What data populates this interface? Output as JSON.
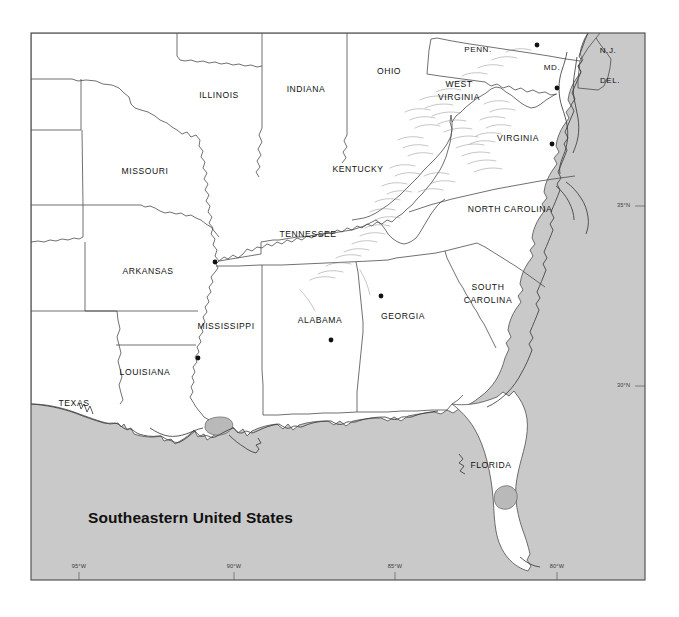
{
  "figure": {
    "title": "Southeastern United States",
    "frame": {
      "x": 31,
      "y": 33,
      "width": 614,
      "height": 547
    },
    "colors": {
      "ocean": "#c9c9c9",
      "land": "#ffffff",
      "border": "#4c4c4c",
      "lake": "#b9b9b9",
      "mountain_hachure": "#8d8d8d",
      "text": "#111111",
      "frame": "#555555",
      "page_background": "#ffffff"
    }
  },
  "map": {
    "projection_note": "",
    "state_labels": [
      {
        "name": "ILLINOIS",
        "text": "ILLINOIS",
        "x": 219,
        "y": 96,
        "size": "normal"
      },
      {
        "name": "INDIANA",
        "text": "INDIANA",
        "x": 306,
        "y": 90,
        "size": "normal"
      },
      {
        "name": "OHIO",
        "text": "OHIO",
        "x": 389,
        "y": 72,
        "size": "normal"
      },
      {
        "name": "PENN.",
        "text": "PENN.",
        "x": 478,
        "y": 50,
        "size": "small"
      },
      {
        "name": "N.J.",
        "text": "N.J.",
        "x": 608,
        "y": 51,
        "size": "small"
      },
      {
        "name": "MD.",
        "text": "MD.",
        "x": 552,
        "y": 68,
        "size": "small"
      },
      {
        "name": "DEL.",
        "text": "DEL.",
        "x": 610,
        "y": 81,
        "size": "small"
      },
      {
        "name": "WEST-VIRGINIA-1",
        "text": "WEST",
        "x": 459,
        "y": 85,
        "size": "normal"
      },
      {
        "name": "WEST-VIRGINIA-2",
        "text": "VIRGINIA",
        "x": 459,
        "y": 98,
        "size": "normal"
      },
      {
        "name": "VIRGINIA",
        "text": "VIRGINIA",
        "x": 518,
        "y": 139,
        "size": "normal"
      },
      {
        "name": "MISSOURI",
        "text": "MISSOURI",
        "x": 145,
        "y": 172,
        "size": "normal"
      },
      {
        "name": "KENTUCKY",
        "text": "KENTUCKY",
        "x": 358,
        "y": 170,
        "size": "normal"
      },
      {
        "name": "NORTH-CAROLINA",
        "text": "NORTH  CAROLINA",
        "x": 510,
        "y": 210,
        "size": "normal"
      },
      {
        "name": "TENNESSEE",
        "text": "TENNESSEE",
        "x": 308,
        "y": 235,
        "size": "normal"
      },
      {
        "name": "ARKANSAS",
        "text": "ARKANSAS",
        "x": 148,
        "y": 272,
        "size": "normal"
      },
      {
        "name": "SOUTH-CAROLINA-1",
        "text": "SOUTH",
        "x": 488,
        "y": 288,
        "size": "normal"
      },
      {
        "name": "SOUTH-CAROLINA-2",
        "text": "CAROLINA",
        "x": 488,
        "y": 301,
        "size": "normal"
      },
      {
        "name": "GEORGIA",
        "text": "GEORGIA",
        "x": 403,
        "y": 317,
        "size": "normal"
      },
      {
        "name": "ALABAMA",
        "text": "ALABAMA",
        "x": 320,
        "y": 321,
        "size": "normal"
      },
      {
        "name": "MISSISSIPPI",
        "text": "MISSISSIPPI",
        "x": 226,
        "y": 327,
        "size": "normal"
      },
      {
        "name": "LOUISIANA",
        "text": "LOUISIANA",
        "x": 145,
        "y": 373,
        "size": "normal"
      },
      {
        "name": "TEXAS",
        "text": "TEXAS",
        "x": 74,
        "y": 404,
        "size": "normal"
      },
      {
        "name": "FLORIDA",
        "text": "FLORIDA",
        "x": 491,
        "y": 466,
        "size": "normal"
      }
    ],
    "city_dots": [
      {
        "name": "city-dot-memphis",
        "x": 215,
        "y": 262
      },
      {
        "name": "city-dot-jackson",
        "x": 198,
        "y": 358
      },
      {
        "name": "city-dot-birmingham",
        "x": 331,
        "y": 340
      },
      {
        "name": "city-dot-atlanta",
        "x": 381,
        "y": 296
      },
      {
        "name": "city-dot-harrisburg",
        "x": 537,
        "y": 45
      },
      {
        "name": "city-dot-annapolis",
        "x": 557,
        "y": 88
      },
      {
        "name": "city-dot-richmond",
        "x": 552,
        "y": 144
      }
    ],
    "graticule": {
      "longitude_labels": [
        {
          "name": "lon-95w",
          "text": "95°W",
          "x": 79,
          "y": 567,
          "tick_x": 79
        },
        {
          "name": "lon-90w",
          "text": "90°W",
          "x": 234,
          "y": 567,
          "tick_x": 234
        },
        {
          "name": "lon-85w",
          "text": "85°W",
          "x": 395,
          "y": 567,
          "tick_x": 395
        },
        {
          "name": "lon-80w",
          "text": "80°W",
          "x": 557,
          "y": 567,
          "tick_x": 557
        }
      ],
      "latitude_labels": [
        {
          "name": "lat-35n",
          "text": "35°N",
          "x": 617,
          "y": 206,
          "tick_y": 206
        },
        {
          "name": "lat-30n",
          "text": "30°N",
          "x": 617,
          "y": 386,
          "tick_y": 386
        }
      ]
    },
    "title_position": {
      "x": 88,
      "y": 519
    }
  }
}
